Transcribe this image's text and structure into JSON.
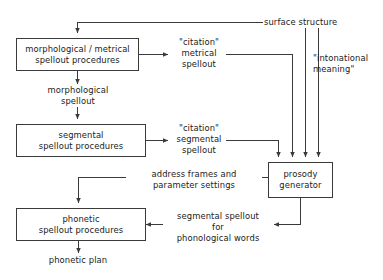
{
  "diagram": {
    "stroke_color": "#3a3a3a",
    "text_color": "#1a1a1a",
    "background_color": "#ffffff",
    "boxes": [
      {
        "id": "morphological-metrical-spellout-procedures",
        "lines": [
          "morphological / metrical",
          "spellout  procedures"
        ]
      },
      {
        "id": "segmental-spellout-procedures",
        "lines": [
          "segmental",
          "spellout  procedures"
        ]
      },
      {
        "id": "phonetic-spellout-procedures",
        "lines": [
          "phonetic",
          "spellout  procedures"
        ]
      },
      {
        "id": "prosody-generator",
        "lines": [
          "prosody",
          "generator"
        ]
      }
    ],
    "labels": [
      {
        "id": "surface-structure",
        "lines": [
          "surface structure"
        ]
      },
      {
        "id": "citation-metrical-spellout",
        "lines": [
          "\"citation\"",
          "metrical",
          "spellout"
        ]
      },
      {
        "id": "intonational-meaning",
        "lines": [
          "\"intonational",
          "meaning\""
        ]
      },
      {
        "id": "morphological-spellout",
        "lines": [
          "morphological",
          "spellout"
        ]
      },
      {
        "id": "citation-segmental-spellout",
        "lines": [
          "\"citation\"",
          "segmental",
          "spellout"
        ]
      },
      {
        "id": "address-frames-and-parameter-settings",
        "lines": [
          "address frames and",
          "parameter settings"
        ]
      },
      {
        "id": "segmental-spellout-for-phonological-words",
        "lines": [
          "segmental spellout",
          "for",
          "phonological words"
        ]
      },
      {
        "id": "phonetic-plan",
        "lines": [
          "phonetic plan"
        ]
      }
    ]
  }
}
